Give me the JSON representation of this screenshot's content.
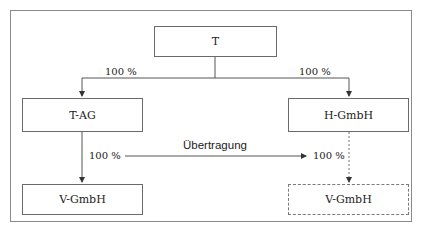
{
  "diagram": {
    "nodes": {
      "t": "T",
      "t_ag": "T-AG",
      "h_gmbh": "H-GmbH",
      "v_gmbh_left": "V-GmbH",
      "v_gmbh_right": "V-GmbH"
    },
    "edges": {
      "t_to_tag": "100 %",
      "t_to_hgmbh": "100 %",
      "tag_to_vgmbh": "100 %",
      "hgmbh_to_vgmbh": "100 %"
    },
    "transfer_label": "Übertragung",
    "colors": {
      "line": "#555555",
      "border": "#6a6a6a",
      "frame": "#8a8a8a"
    }
  }
}
